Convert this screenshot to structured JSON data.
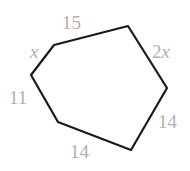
{
  "figure": {
    "name": "hexagon-side-lengths",
    "shape_type": "hexagon",
    "stroke_color": "#1a1a1a",
    "fill_color": "#ffffff",
    "label_color": "#b0b0b0",
    "background_color": "#ffffff",
    "vertices": [
      [
        54,
        45
      ],
      [
        128,
        26
      ],
      [
        167,
        88
      ],
      [
        131,
        150
      ],
      [
        58,
        122
      ],
      [
        31,
        75
      ]
    ],
    "polygon_points": "54,45 128,26 167,88 131,150 58,122 31,75",
    "labels": {
      "top": "15",
      "upper_left": "x",
      "upper_right_coef": "2",
      "upper_right_sym": "x",
      "left": "11",
      "lower_right": "14",
      "bottom": "14"
    },
    "sides": [
      {
        "name": "top-side",
        "label": "15",
        "from": [
          54,
          45
        ],
        "to": [
          128,
          26
        ]
      },
      {
        "name": "upper-right-side",
        "label": "2x",
        "from": [
          128,
          26
        ],
        "to": [
          167,
          88
        ]
      },
      {
        "name": "lower-right-side",
        "label": "14",
        "from": [
          167,
          88
        ],
        "to": [
          131,
          150
        ]
      },
      {
        "name": "bottom-side",
        "label": "14",
        "from": [
          131,
          150
        ],
        "to": [
          58,
          122
        ]
      },
      {
        "name": "left-side",
        "label": "11",
        "from": [
          58,
          122
        ],
        "to": [
          31,
          75
        ]
      },
      {
        "name": "upper-left-side",
        "label": "x",
        "from": [
          31,
          75
        ],
        "to": [
          54,
          45
        ]
      }
    ]
  }
}
